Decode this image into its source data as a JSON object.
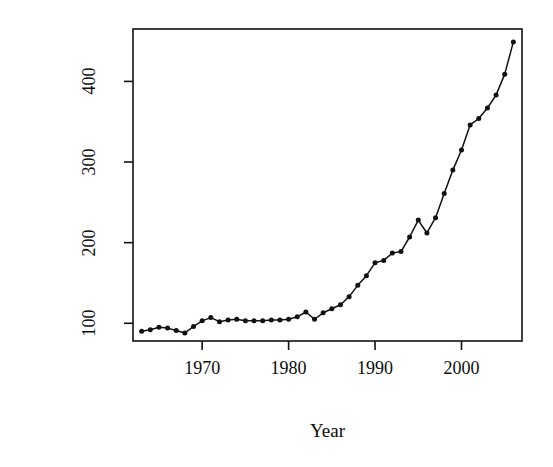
{
  "chart_data": {
    "type": "line",
    "title": "",
    "subtitle": "",
    "xlabel": "Year",
    "ylabel": "Patents (thousands)",
    "xlim": [
      1962,
      2007
    ],
    "ylim": [
      78,
      465
    ],
    "xticks": [
      1970,
      1980,
      1990,
      2000
    ],
    "xticklabels": [
      "1970",
      "1980",
      "1990",
      "2000"
    ],
    "yticks": [
      100,
      200,
      300,
      400
    ],
    "yticklabels": [
      "100",
      "200",
      "300",
      "400"
    ],
    "grid": false,
    "legend": null,
    "marker": "filled-circle",
    "line_color": "#111111",
    "marker_color": "#111111",
    "box": true,
    "x": [
      1963,
      1964,
      1965,
      1966,
      1967,
      1968,
      1969,
      1970,
      1971,
      1972,
      1973,
      1974,
      1975,
      1976,
      1977,
      1978,
      1979,
      1980,
      1981,
      1982,
      1983,
      1984,
      1985,
      1986,
      1987,
      1988,
      1989,
      1990,
      1991,
      1992,
      1993,
      1994,
      1995,
      1996,
      1997,
      1998,
      1999,
      2000,
      2001,
      2002,
      2003,
      2004,
      2005,
      2006
    ],
    "y": [
      90,
      92,
      95,
      94,
      91,
      88,
      96,
      103,
      107,
      102,
      104,
      105,
      103,
      103,
      103,
      104,
      104,
      105,
      108,
      114,
      105,
      113,
      118,
      123,
      133,
      147,
      159,
      175,
      178,
      187,
      189,
      207,
      228,
      212,
      231,
      261,
      290,
      315,
      346,
      354,
      367,
      383,
      409,
      449
    ],
    "annotations": []
  },
  "figure": {
    "width": 553,
    "height": 467,
    "background": "#ffffff",
    "plot_area": {
      "left": 133,
      "top": 29,
      "right": 522,
      "bottom": 341
    },
    "ink_color": "#111111"
  }
}
